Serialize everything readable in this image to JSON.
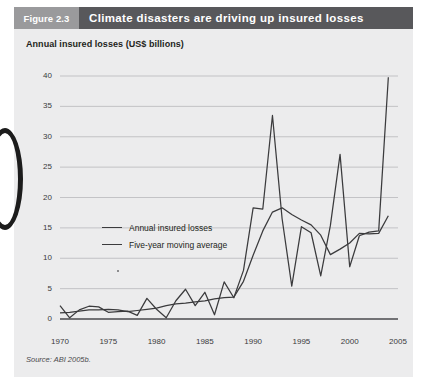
{
  "figure": {
    "tag": "Figure 2.3",
    "title": "Climate disasters are driving up insured losses",
    "axis_title": "Annual insured losses (US$ billions)",
    "source": "Source: ABI 2005b."
  },
  "chart_data": {
    "type": "line",
    "title": "Climate disasters are driving up insured losses",
    "subtitle": "Annual insured losses (US$ billions)",
    "xlabel": "",
    "ylabel": "Annual insured losses (US$ billions)",
    "xlim": [
      1970,
      2005
    ],
    "ylim": [
      0,
      40
    ],
    "ytick_labels": [
      "0",
      "5",
      "10",
      "15",
      "20",
      "25",
      "30",
      "35",
      "40"
    ],
    "ytick_values": [
      0,
      5,
      10,
      15,
      20,
      25,
      30,
      35,
      40
    ],
    "xtick_labels": [
      "1970",
      "1975",
      "1980",
      "1985",
      "1990",
      "1995",
      "2000",
      "2005"
    ],
    "xtick_values": [
      1970,
      1975,
      1980,
      1985,
      1990,
      1995,
      2000,
      2005
    ],
    "grid": true,
    "legend_position": "inside-left",
    "x": [
      1970,
      1971,
      1972,
      1973,
      1974,
      1975,
      1976,
      1977,
      1978,
      1979,
      1980,
      1981,
      1982,
      1983,
      1984,
      1985,
      1986,
      1987,
      1988,
      1989,
      1990,
      1991,
      1992,
      1993,
      1994,
      1995,
      1996,
      1997,
      1998,
      1999,
      2000,
      2001,
      2002,
      2003,
      2004
    ],
    "series": [
      {
        "name": "Annual insured losses",
        "values": [
          2.2,
          0.2,
          1.5,
          2.1,
          2.0,
          1.1,
          1.2,
          1.3,
          0.6,
          3.4,
          1.6,
          0.2,
          3.0,
          4.9,
          2.2,
          4.4,
          0.7,
          6.1,
          3.5,
          8.0,
          18.3,
          18.1,
          33.5,
          16.5,
          5.4,
          15.2,
          14.2,
          7.1,
          15.4,
          27.1,
          8.6,
          13.7,
          14.3,
          14.5,
          39.8
        ]
      },
      {
        "name": "Five-year moving average",
        "values": [
          1.0,
          1.1,
          1.3,
          1.5,
          1.5,
          1.6,
          1.5,
          1.2,
          1.4,
          1.6,
          1.8,
          2.2,
          2.5,
          2.6,
          2.8,
          3.0,
          3.3,
          3.5,
          3.6,
          6.2,
          10.5,
          14.5,
          17.6,
          18.3,
          17.2,
          16.3,
          15.5,
          13.8,
          10.6,
          11.5,
          12.5,
          14.1,
          14.0,
          14.1,
          17.0
        ]
      }
    ]
  },
  "legend": {
    "items": [
      {
        "label": "Annual insured losses"
      },
      {
        "label": "Five-year moving average"
      }
    ]
  }
}
